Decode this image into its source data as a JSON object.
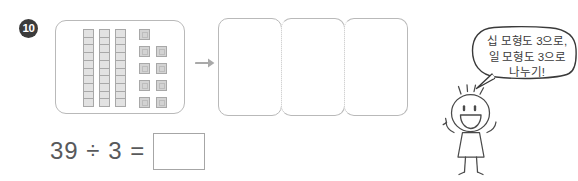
{
  "problem": {
    "number": "10",
    "equation_text": "39 ÷ 3 =",
    "answer_value": "",
    "answer_placeholder": ""
  },
  "source_panel": {
    "label": "base-ten-blocks-39",
    "tens_rods": 3,
    "segments_per_rod": 10,
    "ones_units": 9,
    "total_value": "39",
    "rod_fill": "#e2e2e2",
    "rod_stroke": "#a8a8a8",
    "unit_fill": "#d3d3d3",
    "unit_stroke": "#a8a8a8",
    "unit_layout": [
      1,
      2,
      2,
      2,
      2
    ]
  },
  "arrow": {
    "icon": "arrow-right-icon",
    "color": "#a9a9a9"
  },
  "groups": {
    "count": 3,
    "boxes": [
      {
        "label": "group-1",
        "contents": ""
      },
      {
        "label": "group-2",
        "contents": ""
      },
      {
        "label": "group-3",
        "contents": ""
      }
    ],
    "divider_style": "dotted",
    "border_color": "#b9b9b9"
  },
  "character": {
    "icon": "stick-figure-girl-icon",
    "stroke": "#4a4a4a"
  },
  "speech_bubble": {
    "lines": [
      "십 모형도 3으로,",
      "일 모형도 3으로",
      "나누기!"
    ],
    "line1": "십 모형도 3으로,",
    "line2": "일 모형도 3으로",
    "line3": "나누기!",
    "stroke": "#3a3a3a"
  },
  "colors": {
    "page_background": "#ffffff",
    "badge_background": "#3b3b3b",
    "badge_text": "#ffffff",
    "equation_text": "#58595b",
    "panel_border": "#b9b9b9"
  }
}
